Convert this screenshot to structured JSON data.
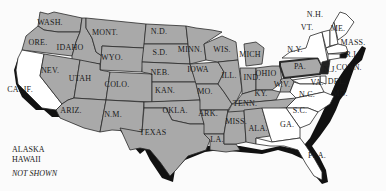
{
  "map": {
    "states": [
      {
        "id": "WASH.",
        "x": 50,
        "y": 25
      },
      {
        "id": "ORE.",
        "x": 38,
        "y": 45
      },
      {
        "id": "CALIF.",
        "x": 20,
        "y": 92
      },
      {
        "id": "IDAHO",
        "x": 70,
        "y": 50
      },
      {
        "id": "NEV.",
        "x": 50,
        "y": 73
      },
      {
        "id": "MONT.",
        "x": 105,
        "y": 35
      },
      {
        "id": "WYO.",
        "x": 112,
        "y": 60
      },
      {
        "id": "UTAH",
        "x": 80,
        "y": 81
      },
      {
        "id": "ARIZ.",
        "x": 71,
        "y": 113
      },
      {
        "id": "COLO.",
        "x": 117,
        "y": 87
      },
      {
        "id": "N.M.",
        "x": 113,
        "y": 117
      },
      {
        "id": "N.D.",
        "x": 159,
        "y": 34
      },
      {
        "id": "S.D.",
        "x": 160,
        "y": 55
      },
      {
        "id": "NEB.",
        "x": 160,
        "y": 75
      },
      {
        "id": "KAN.",
        "x": 165,
        "y": 93
      },
      {
        "id": "OKLA.",
        "x": 175,
        "y": 113
      },
      {
        "id": "TEXAS",
        "x": 153,
        "y": 135
      },
      {
        "id": "MINN.",
        "x": 190,
        "y": 52
      },
      {
        "id": "IOWA",
        "x": 198,
        "y": 72
      },
      {
        "id": "MO.",
        "x": 205,
        "y": 94
      },
      {
        "id": "ARK.",
        "x": 208,
        "y": 116
      },
      {
        "id": "LA.",
        "x": 217,
        "y": 142
      },
      {
        "id": "WIS.",
        "x": 222,
        "y": 52
      },
      {
        "id": "ILL.",
        "x": 229,
        "y": 78
      },
      {
        "id": "MISS.",
        "x": 236,
        "y": 124
      },
      {
        "id": "MICH",
        "x": 250,
        "y": 57
      },
      {
        "id": "IND.",
        "x": 252,
        "y": 80
      },
      {
        "id": "OHIO",
        "x": 266,
        "y": 76
      },
      {
        "id": "KY.",
        "x": 261,
        "y": 96
      },
      {
        "id": "TENN.",
        "x": 245,
        "y": 106
      },
      {
        "id": "ALA.",
        "x": 258,
        "y": 131
      },
      {
        "id": "W.V.",
        "x": 282,
        "y": 87
      },
      {
        "id": "PA.",
        "x": 300,
        "y": 69
      },
      {
        "id": "N.Y.",
        "x": 295,
        "y": 52
      },
      {
        "id": "VT.",
        "x": 307,
        "y": 30
      },
      {
        "id": "N.H.",
        "x": 315,
        "y": 17
      },
      {
        "id": "ME.",
        "x": 338,
        "y": 31
      },
      {
        "id": "MASS.",
        "x": 353,
        "y": 45
      },
      {
        "id": "R.I.",
        "x": 352,
        "y": 57
      },
      {
        "id": "CONN.",
        "x": 349,
        "y": 70
      },
      {
        "id": "N.J.",
        "x": 330,
        "y": 72
      },
      {
        "id": "DEL.",
        "x": 337,
        "y": 84
      },
      {
        "id": "MD.",
        "x": 340,
        "y": 96
      },
      {
        "id": "VA.",
        "x": 317,
        "y": 85
      },
      {
        "id": "N.C.",
        "x": 307,
        "y": 97
      },
      {
        "id": "S.C.",
        "x": 300,
        "y": 113
      },
      {
        "id": "GA.",
        "x": 287,
        "y": 127
      },
      {
        "id": "FLA.",
        "x": 317,
        "y": 158
      }
    ],
    "note": {
      "line1": "ALASKA",
      "line2": "HAWAII",
      "line3": "NOT SHOWN"
    },
    "colors": {
      "state_fill": "#a9a9a9",
      "white_state_fill": "#ffffff",
      "shadow": "#111111",
      "border": "#2a2a2a"
    }
  }
}
